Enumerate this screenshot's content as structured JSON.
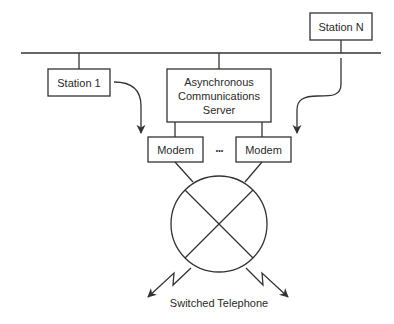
{
  "diagram": {
    "nodes": {
      "station1": {
        "label": "Station 1"
      },
      "stationN": {
        "label": "Station N"
      },
      "server": {
        "lines": [
          "Asynchronous",
          "Communications",
          "Server"
        ]
      },
      "modem1": {
        "label": "Modem"
      },
      "modem2": {
        "label": "Modem"
      },
      "ellipsis": "•••",
      "switch": {
        "label": ""
      }
    },
    "caption": "Switched Telephone",
    "colors": {
      "stroke": "#333333",
      "text": "#2a2a2a",
      "background": "#ffffff"
    }
  }
}
